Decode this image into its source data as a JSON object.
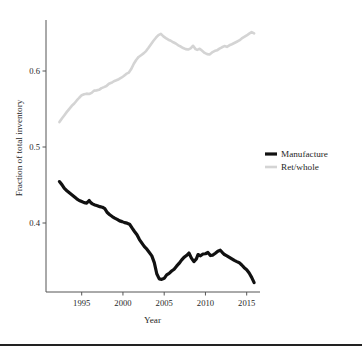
{
  "chart_data": {
    "type": "line",
    "title": "",
    "xlabel": "Year",
    "ylabel": "Fraction of total inventory",
    "xlim": [
      1992.2,
      2016.2
    ],
    "ylim": [
      0.312,
      0.665
    ],
    "grid": false,
    "legend_position": "right",
    "xticks": [
      1995,
      2000,
      2005,
      2010,
      2015
    ],
    "xtick_labels": [
      "1995",
      "2000",
      "2005",
      "2010",
      "2015"
    ],
    "yticks": [
      0.4,
      0.5,
      0.6
    ],
    "ytick_labels": [
      "0.4",
      "0.5",
      "0.6"
    ],
    "colors": {
      "manufacture": "#111111",
      "ret_whole": "#d4d4d4",
      "axis": "#555555",
      "text": "#1f1f1f",
      "background": "#ffffff",
      "bottom_rule": "#222222"
    },
    "series": [
      {
        "name": "Manufacture",
        "color": "#111111",
        "line_width": 3.2,
        "x": [
          1992.3,
          1992.6,
          1992.9,
          1993.2,
          1993.5,
          1993.8,
          1994.1,
          1994.4,
          1994.7,
          1995.0,
          1995.3,
          1995.6,
          1995.9,
          1996.1,
          1996.3,
          1996.6,
          1996.9,
          1997.2,
          1997.5,
          1997.8,
          1998.1,
          1998.4,
          1998.7,
          1999.0,
          1999.3,
          1999.6,
          1999.9,
          2000.2,
          2000.5,
          2000.8,
          2001.1,
          2001.4,
          2001.7,
          2002.0,
          2002.3,
          2002.6,
          2002.9,
          2003.2,
          2003.5,
          2003.8,
          2004.1,
          2004.4,
          2004.7,
          2005.0,
          2005.3,
          2005.6,
          2005.9,
          2006.2,
          2006.5,
          2006.8,
          2007.1,
          2007.4,
          2007.7,
          2008.0,
          2008.3,
          2008.6,
          2008.9,
          2009.1,
          2009.4,
          2009.7,
          2010.0,
          2010.3,
          2010.6,
          2010.9,
          2011.2,
          2011.5,
          2011.8,
          2012.0,
          2012.3,
          2012.6,
          2012.9,
          2013.2,
          2013.5,
          2013.8,
          2014.1,
          2014.4,
          2014.7,
          2015.0,
          2015.3,
          2015.6,
          2015.9
        ],
        "y": [
          0.4545,
          0.4505,
          0.4455,
          0.4425,
          0.4398,
          0.4372,
          0.4345,
          0.4318,
          0.4296,
          0.4282,
          0.4268,
          0.4262,
          0.4296,
          0.4268,
          0.4252,
          0.4238,
          0.4228,
          0.4215,
          0.4208,
          0.4188,
          0.4138,
          0.4108,
          0.4085,
          0.4065,
          0.4048,
          0.4028,
          0.4018,
          0.4005,
          0.3998,
          0.3985,
          0.3935,
          0.3888,
          0.3845,
          0.3782,
          0.3735,
          0.3688,
          0.3655,
          0.3612,
          0.3568,
          0.3478,
          0.3332,
          0.3265,
          0.3258,
          0.3272,
          0.3318,
          0.3338,
          0.3368,
          0.3392,
          0.3432,
          0.3468,
          0.3512,
          0.3548,
          0.3572,
          0.3605,
          0.3538,
          0.3492,
          0.3528,
          0.3585,
          0.3568,
          0.3592,
          0.3595,
          0.3612,
          0.3572,
          0.3578,
          0.3602,
          0.3628,
          0.3642,
          0.3618,
          0.3585,
          0.3568,
          0.3548,
          0.3528,
          0.3508,
          0.3492,
          0.3478,
          0.3448,
          0.3412,
          0.3385,
          0.3342,
          0.3285,
          0.3215
        ]
      },
      {
        "name": "Ret/whole",
        "color": "#d4d4d4",
        "line_width": 2.6,
        "x": [
          1992.3,
          1992.6,
          1992.9,
          1993.2,
          1993.5,
          1993.8,
          1994.1,
          1994.4,
          1994.7,
          1995.0,
          1995.3,
          1995.6,
          1995.9,
          1996.2,
          1996.5,
          1996.8,
          1997.1,
          1997.4,
          1997.7,
          1998.0,
          1998.3,
          1998.6,
          1998.9,
          1999.2,
          1999.5,
          1999.8,
          2000.1,
          2000.4,
          2000.7,
          2001.0,
          2001.3,
          2001.6,
          2001.9,
          2002.2,
          2002.5,
          2002.8,
          2003.1,
          2003.4,
          2003.7,
          2004.0,
          2004.3,
          2004.6,
          2004.9,
          2005.2,
          2005.5,
          2005.8,
          2006.1,
          2006.4,
          2006.7,
          2007.0,
          2007.3,
          2007.6,
          2007.9,
          2008.2,
          2008.5,
          2008.8,
          2009.0,
          2009.3,
          2009.6,
          2009.9,
          2010.2,
          2010.5,
          2010.8,
          2011.1,
          2011.4,
          2011.7,
          2012.0,
          2012.3,
          2012.6,
          2012.9,
          2013.2,
          2013.5,
          2013.8,
          2014.1,
          2014.4,
          2014.7,
          2015.0,
          2015.3,
          2015.6,
          2015.9
        ],
        "y": [
          0.5328,
          0.5375,
          0.5418,
          0.5462,
          0.5502,
          0.5542,
          0.5572,
          0.5612,
          0.5648,
          0.5682,
          0.5695,
          0.5702,
          0.5698,
          0.5712,
          0.5742,
          0.5745,
          0.5752,
          0.5775,
          0.5788,
          0.5802,
          0.5832,
          0.5845,
          0.5865,
          0.5878,
          0.5892,
          0.5912,
          0.5935,
          0.5962,
          0.5978,
          0.6025,
          0.6092,
          0.6145,
          0.6185,
          0.6208,
          0.6232,
          0.6262,
          0.6305,
          0.6352,
          0.6398,
          0.6438,
          0.6472,
          0.6488,
          0.6455,
          0.6432,
          0.6412,
          0.6398,
          0.6378,
          0.6362,
          0.6338,
          0.6322,
          0.6302,
          0.6288,
          0.6282,
          0.6298,
          0.6332,
          0.6288,
          0.6278,
          0.6292,
          0.6265,
          0.6238,
          0.6222,
          0.6218,
          0.6245,
          0.6262,
          0.6272,
          0.6295,
          0.6312,
          0.6328,
          0.6318,
          0.6338,
          0.6352,
          0.6368,
          0.6385,
          0.6402,
          0.6428,
          0.6448,
          0.6468,
          0.6492,
          0.6512,
          0.6495
        ]
      }
    ]
  },
  "legend": {
    "entries": [
      {
        "label": "Manufacture",
        "color": "#111111"
      },
      {
        "label": "Ret/whole",
        "color": "#d4d4d4"
      }
    ]
  }
}
